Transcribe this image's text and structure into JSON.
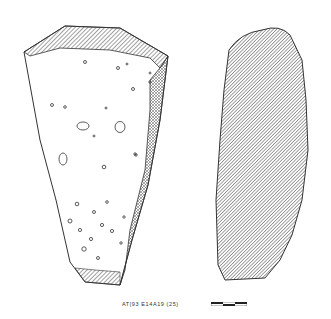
{
  "drawing": {
    "type": "archaeological artifact illustration",
    "views": [
      {
        "name": "face-view",
        "description": "triangular stone fragment with pitted surface and hatched edges"
      },
      {
        "name": "profile-view",
        "description": "fully hatched side section"
      }
    ],
    "caption": "AT|93 E14A19 (25)",
    "scale_bar": {
      "segments": 3
    }
  },
  "colors": {
    "ink": "#3a3a3a",
    "paper": "#ffffff"
  }
}
